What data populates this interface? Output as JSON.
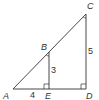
{
  "diagram": {
    "type": "similar-right-triangles",
    "stroke_color": "#333333",
    "points": {
      "A": {
        "label": "A"
      },
      "B": {
        "label": "B"
      },
      "C": {
        "label": "C"
      },
      "D": {
        "label": "D"
      },
      "E": {
        "label": "E"
      }
    },
    "lengths": {
      "AE": "4",
      "BE": "3",
      "CD": "5"
    },
    "right_angles": [
      "E",
      "D"
    ],
    "marked_angles": [
      "B",
      "C"
    ]
  }
}
